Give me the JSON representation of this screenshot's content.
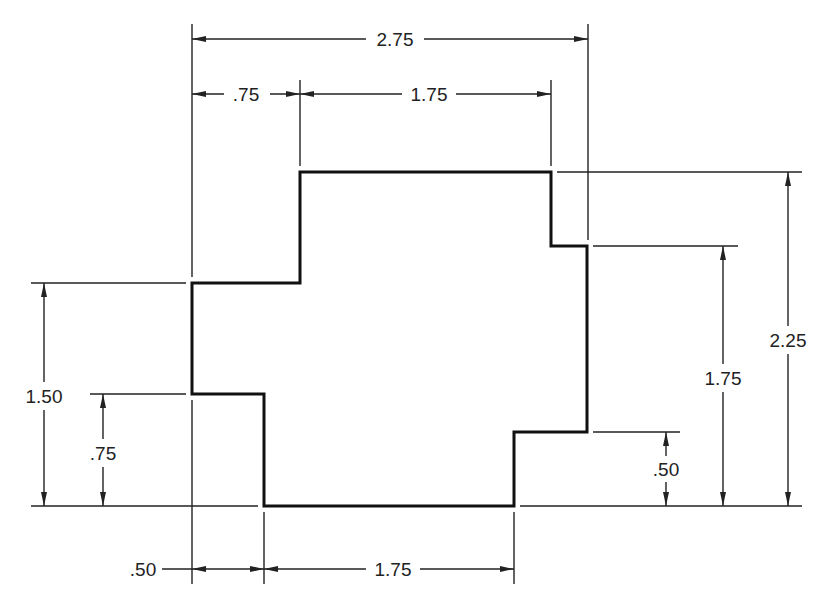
{
  "drawing": {
    "type": "dimensioned-profile",
    "units": "inches",
    "stroke_color": "#111111",
    "background": "#ffffff",
    "horizontal_dimensions": {
      "overall_top": "2.75",
      "top_left_step": ".75",
      "top_right_step": "1.75",
      "bottom_left_step": ".50",
      "bottom_width": "1.75"
    },
    "vertical_dimensions": {
      "left_overall": "1.50",
      "left_step": ".75",
      "right_step": ".50",
      "right_middle": "1.75",
      "right_overall": "2.25"
    }
  }
}
